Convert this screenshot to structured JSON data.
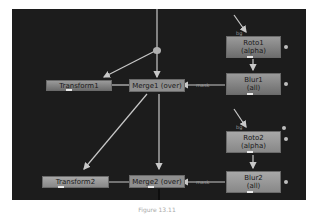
{
  "graph": {
    "nodes": {
      "roto1": {
        "line1": "Roto1",
        "line2": "(alpha)"
      },
      "blur1": {
        "line1": "Blur1",
        "line2": "(all)"
      },
      "roto2": {
        "line1": "Roto2",
        "line2": "(alpha)"
      },
      "blur2": {
        "line1": "Blur2",
        "line2": "(all)"
      },
      "transform1": {
        "label": "Transform1"
      },
      "transform2": {
        "label": "Transform2"
      },
      "merge1": {
        "label": "Merge1 (over)"
      },
      "merge2": {
        "label": "Merge2 (over)"
      }
    },
    "wire_labels": {
      "mask1": "mask",
      "mask2": "mask",
      "bg1": "bg",
      "bg2": "bg"
    },
    "colors": {
      "canvas": "#1c1c1c",
      "wire": "#c8c8c8",
      "node": "#8f8f8f"
    }
  },
  "caption": "Figure 13.11"
}
